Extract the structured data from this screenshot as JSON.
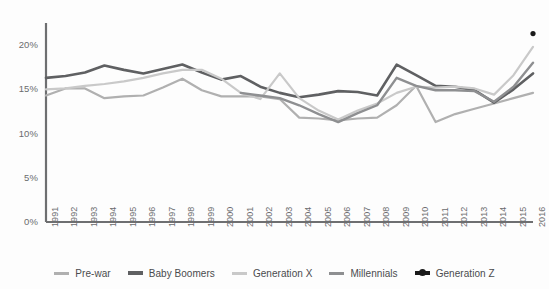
{
  "chart_data": {
    "type": "line",
    "title": "",
    "xlabel": "",
    "ylabel": "",
    "grid": false,
    "legend_position": "bottom",
    "ylim": [
      0,
      22.5
    ],
    "ytick_values": [
      0,
      5,
      10,
      15,
      20
    ],
    "ytick_labels": [
      "0%",
      "5%",
      "10%",
      "15%",
      "20%"
    ],
    "categories": [
      "1991",
      "1992",
      "1993",
      "1994",
      "1995",
      "1996",
      "1997",
      "1998",
      "1999",
      "2000",
      "2001",
      "2002",
      "2003",
      "2004",
      "2005",
      "2006",
      "2007",
      "2008",
      "2009",
      "2010",
      "2011",
      "2012",
      "2013",
      "2014",
      "2015",
      "2016"
    ],
    "series": [
      {
        "name": "Pre-war",
        "color": "#b0b0b0",
        "width": 2.2,
        "marker": false,
        "values": [
          14.3,
          15.1,
          15.1,
          14.0,
          14.2,
          14.3,
          15.2,
          16.2,
          14.9,
          14.2,
          14.2,
          14.2,
          13.9,
          11.8,
          11.7,
          11.5,
          11.7,
          11.8,
          13.2,
          15.4,
          11.3,
          12.2,
          12.8,
          13.4,
          14.0,
          14.6
        ]
      },
      {
        "name": "Baby Boomers",
        "color": "#5f6062",
        "width": 2.6,
        "marker": false,
        "values": [
          16.3,
          16.5,
          16.9,
          17.7,
          17.2,
          16.8,
          17.3,
          17.8,
          16.9,
          16.1,
          16.5,
          15.3,
          14.6,
          14.1,
          14.4,
          14.8,
          14.7,
          14.3,
          17.8,
          16.6,
          15.4,
          15.3,
          14.9,
          13.5,
          15.0,
          16.8
        ]
      },
      {
        "name": "Generation X",
        "color": "#c9c9c9",
        "width": 2.2,
        "marker": false,
        "values": [
          15.0,
          15.1,
          15.4,
          15.6,
          15.9,
          16.3,
          16.8,
          17.2,
          17.2,
          16.2,
          14.6,
          13.9,
          16.8,
          14.0,
          12.6,
          11.6,
          12.6,
          13.4,
          14.6,
          15.3,
          15.2,
          15.3,
          15.1,
          14.4,
          16.6,
          19.8
        ]
      },
      {
        "name": "Millennials",
        "color": "#8e8f91",
        "width": 2.4,
        "marker": false,
        "start_index": 10,
        "values": [
          null,
          null,
          null,
          null,
          null,
          null,
          null,
          null,
          null,
          null,
          14.6,
          14.3,
          14.0,
          13.2,
          12.2,
          11.3,
          12.3,
          13.2,
          16.3,
          15.4,
          14.9,
          14.9,
          14.8,
          13.6,
          15.3,
          18.0
        ]
      },
      {
        "name": "Generation Z",
        "color": "#1a1a1a",
        "width": 2.6,
        "marker": true,
        "values": [
          null,
          null,
          null,
          null,
          null,
          null,
          null,
          null,
          null,
          null,
          null,
          null,
          null,
          null,
          null,
          null,
          null,
          null,
          null,
          null,
          null,
          null,
          null,
          null,
          null,
          21.3
        ]
      }
    ]
  },
  "legend": {
    "items": [
      {
        "label": "Pre-war"
      },
      {
        "label": "Baby Boomers"
      },
      {
        "label": "Generation X"
      },
      {
        "label": "Millennials"
      },
      {
        "label": "Generation Z"
      }
    ]
  }
}
